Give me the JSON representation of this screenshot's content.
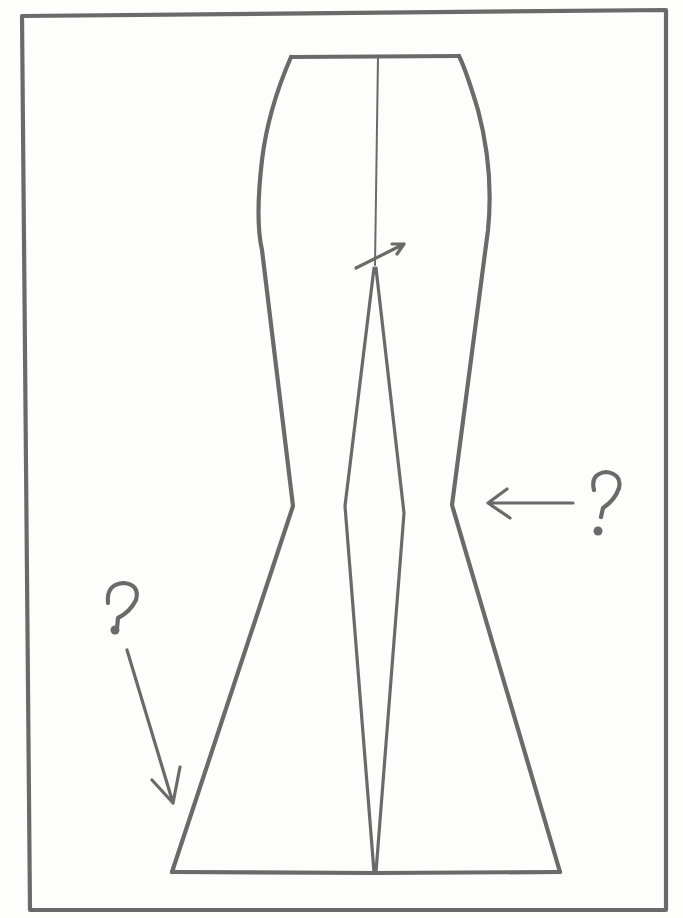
{
  "diagram": {
    "subject": "Flared trouser pattern sketch",
    "annotations": [
      {
        "id": "knee-question",
        "text": "?",
        "arrow": "left",
        "target": "right knee notch"
      },
      {
        "id": "hem-question",
        "text": "?",
        "arrow": "down-right",
        "target": "left hem flare"
      }
    ],
    "ink_color": "#6a6a6a",
    "paper_color": "#fdfdfc"
  }
}
